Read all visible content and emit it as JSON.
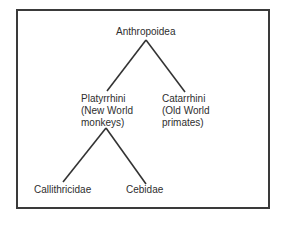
{
  "diagram": {
    "type": "taxonomic-tree",
    "root": {
      "label": "Anthropoidea",
      "children": [
        {
          "label": "Platyrrhini\n(New World\nmonkeys)",
          "children": [
            {
              "label": "Callithricidae"
            },
            {
              "label": "Cebidae"
            }
          ]
        },
        {
          "label": "Catarrhini\n(Old World\nprimates)"
        }
      ]
    }
  },
  "nodes": {
    "anthropoidea": "Anthropoidea",
    "platyrrhini": "Platyrrhini\n(New World\nmonkeys)",
    "catarrhini": "Catarrhini\n(Old World\nprimates)",
    "callithricidae": "Callithricidae",
    "cebidae": "Cebidae"
  },
  "colors": {
    "line": "#333333",
    "text": "#2e2e2e",
    "border": "#3a3a3a"
  }
}
